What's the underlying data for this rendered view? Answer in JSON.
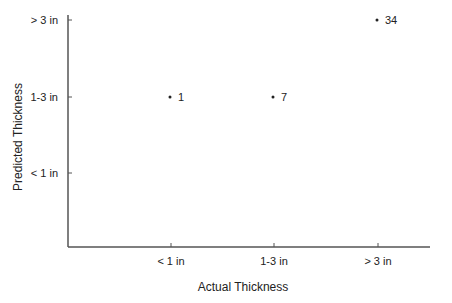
{
  "chart_data": {
    "type": "scatter",
    "title": "",
    "xlabel": "Actual Thickness",
    "ylabel": "Predicted Thickness",
    "x_categories": [
      "< 1 in",
      "1-3 in",
      "> 3 in"
    ],
    "y_categories": [
      "< 1 in",
      "1-3 in",
      "> 3 in"
    ],
    "points": [
      {
        "x": "< 1 in",
        "y": "1-3 in",
        "label": "1"
      },
      {
        "x": "1-3 in",
        "y": "1-3 in",
        "label": "7"
      },
      {
        "x": "> 3 in",
        "y": "> 3 in",
        "label": "34"
      }
    ],
    "grid": false,
    "legend": null
  },
  "colors": {
    "axis": "#555555",
    "text": "#222222",
    "marker": "#222222"
  }
}
